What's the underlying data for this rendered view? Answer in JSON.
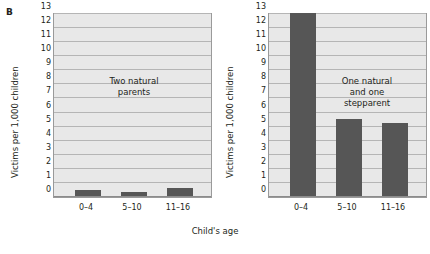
{
  "figure": {
    "panel_letter": "B",
    "xaxis_title": "Child's age"
  },
  "chart_data": {
    "type": "bar",
    "title": "",
    "xlabel": "Child's age",
    "ylabel": "Victims per 1,000 children",
    "categories": [
      "0–4",
      "5–10",
      "11–16"
    ],
    "ylim": [
      0,
      13
    ],
    "ytick_values": [
      0,
      1,
      2,
      3,
      4,
      5,
      6,
      7,
      8,
      9,
      10,
      11,
      12,
      13
    ],
    "ytick_labels": [
      "0",
      "1",
      "2",
      "3",
      "4",
      "5",
      "6",
      "7",
      "8",
      "9",
      "10",
      "11",
      "12",
      "13"
    ],
    "grid": true,
    "legend": "none",
    "bar_color": "#565656",
    "plot_background": "#e8e8e8",
    "panels": [
      {
        "name": "two-natural-parents",
        "annotation": "Two natural\nparents",
        "ylabel": "Victims per 1,000 children",
        "categories": [
          "0–4",
          "5–10",
          "11–16"
        ],
        "values": [
          0.4,
          0.3,
          0.6
        ]
      },
      {
        "name": "one-natural-one-stepparent",
        "annotation": "One natural\nand one\nstepparent",
        "ylabel": "Victims per 1,000 children",
        "categories": [
          "0–4",
          "5–10",
          "11–16"
        ],
        "values": [
          13.0,
          5.5,
          5.2
        ]
      }
    ]
  }
}
